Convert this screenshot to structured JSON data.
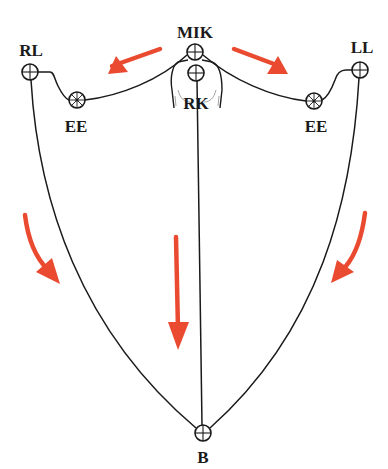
{
  "diagram": {
    "colors": {
      "line": "#1a1a1a",
      "arrow": "#ea4a2f",
      "background": "#ffffff"
    },
    "nodes": [
      {
        "id": "MIK",
        "label": "MIK",
        "type": "crosshair-circle"
      },
      {
        "id": "RK",
        "label": "RK",
        "type": "crosshair-circle"
      },
      {
        "id": "RL",
        "label": "RL",
        "type": "crosshair-circle"
      },
      {
        "id": "LL",
        "label": "LL",
        "type": "crosshair-circle"
      },
      {
        "id": "EE_left",
        "label": "EE",
        "type": "spoked-circle"
      },
      {
        "id": "EE_right",
        "label": "EE",
        "type": "spoked-circle"
      },
      {
        "id": "B",
        "label": "B",
        "type": "crosshair-circle"
      }
    ],
    "edges": [
      {
        "from": "RL",
        "to": "EE_left"
      },
      {
        "from": "EE_left",
        "to": "MIK"
      },
      {
        "from": "MIK",
        "to": "EE_right"
      },
      {
        "from": "EE_right",
        "to": "LL"
      },
      {
        "from": "RL",
        "to": "B"
      },
      {
        "from": "LL",
        "to": "B"
      },
      {
        "from": "RK",
        "to": "B"
      }
    ],
    "arrows": [
      {
        "name": "arrow-up-left",
        "direction": "toward RL"
      },
      {
        "name": "arrow-up-right",
        "direction": "toward LL"
      },
      {
        "name": "arrow-left-down",
        "direction": "down along left curve"
      },
      {
        "name": "arrow-center-down",
        "direction": "down toward B"
      },
      {
        "name": "arrow-right-down",
        "direction": "down along right curve"
      }
    ]
  }
}
